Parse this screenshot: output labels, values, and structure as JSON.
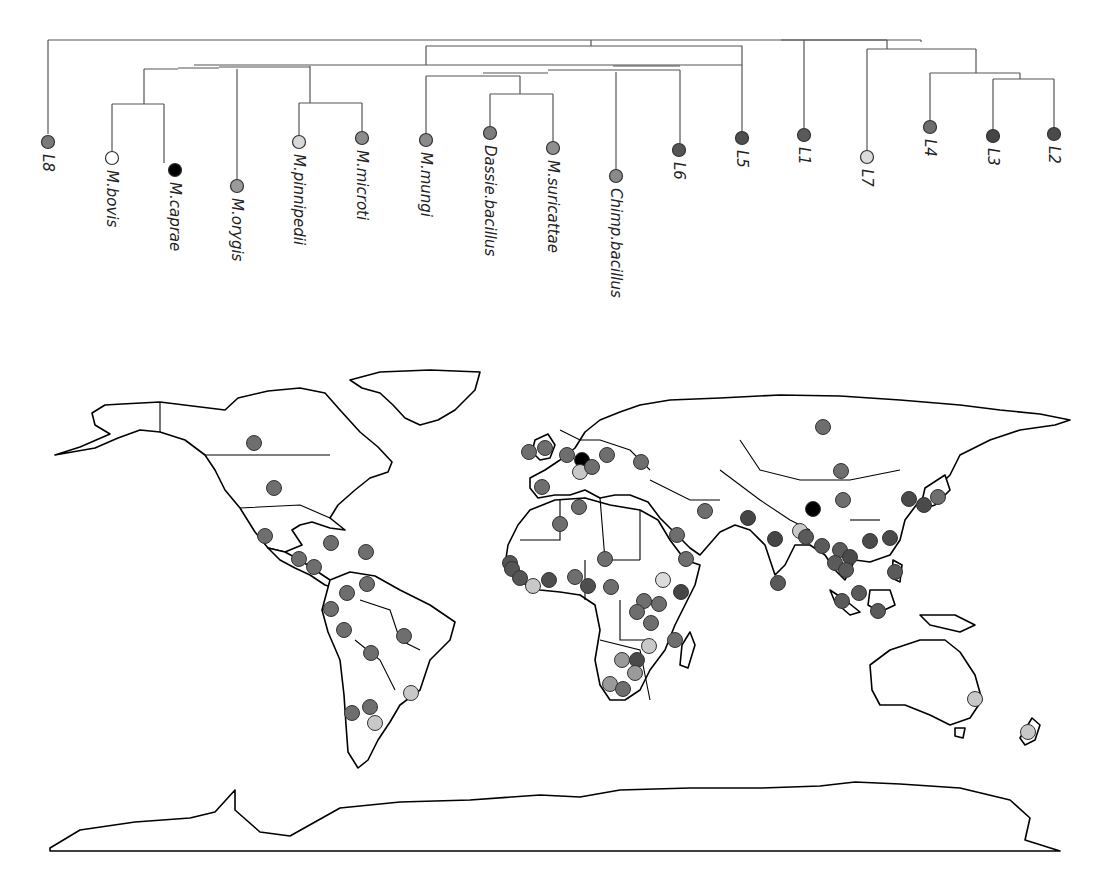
{
  "figure": {
    "colors": {
      "L1": "#5a5a5a",
      "L2": "#4a4a4a",
      "L3": "#454545",
      "L4": "#6e6e6e",
      "L5": "#4e4e4e",
      "L6": "#555555",
      "L7": "#dcdcdc",
      "L8": "#7a7a7a",
      "M.bovis": "#ffffff",
      "M.caprae": "#000000",
      "M.orygis": "#9a9a9a",
      "M.pinnipedii": "#d8d8d8",
      "M.microti": "#8c8c8c",
      "M.mungi": "#8a8a8a",
      "Dassie.bacillus": "#7c7c7c",
      "M.suricattae": "#8e8e8e",
      "Chimp.bacillus": "#8a8a8a",
      "animal_default": "#9a9a9a",
      "map_light": "#c8c8c8"
    }
  },
  "tree": {
    "leaves": [
      {
        "id": "L8",
        "label": "L8",
        "x": 48,
        "y": 142
      },
      {
        "id": "M.bovis",
        "label": "M.bovis",
        "x": 112,
        "y": 158
      },
      {
        "id": "M.caprae",
        "label": "M.caprae",
        "x": 175,
        "y": 170
      },
      {
        "id": "M.orygis",
        "label": "M.orygis",
        "x": 237,
        "y": 186
      },
      {
        "id": "M.pinnipedii",
        "label": "M.pinnipedii",
        "x": 299,
        "y": 142
      },
      {
        "id": "M.microti",
        "label": "M.microti",
        "x": 362,
        "y": 138
      },
      {
        "id": "M.mungi",
        "label": "M.mungi",
        "x": 426,
        "y": 140
      },
      {
        "id": "Dassie.bacillus",
        "label": "Dassie.bacillus",
        "x": 490,
        "y": 133
      },
      {
        "id": "M.suricattae",
        "label": "M.suricattae",
        "x": 553,
        "y": 148
      },
      {
        "id": "Chimp.bacillus",
        "label": "Chimp.bacillus",
        "x": 616,
        "y": 176
      },
      {
        "id": "L6",
        "label": "L6",
        "x": 679,
        "y": 150
      },
      {
        "id": "L5",
        "label": "L5",
        "x": 742,
        "y": 138
      },
      {
        "id": "L1",
        "label": "L1",
        "x": 804,
        "y": 135
      },
      {
        "id": "L7",
        "label": "L7",
        "x": 867,
        "y": 157
      },
      {
        "id": "L4",
        "label": "L4",
        "x": 930,
        "y": 127
      },
      {
        "id": "L3",
        "label": "L3",
        "x": 993,
        "y": 136
      },
      {
        "id": "L2",
        "label": "L2",
        "x": 1054,
        "y": 134
      }
    ]
  },
  "map": {
    "points": [
      {
        "region": "Canada",
        "x": 254,
        "y": 443,
        "lineage": "L4"
      },
      {
        "region": "USA",
        "x": 274,
        "y": 488,
        "lineage": "L4"
      },
      {
        "region": "Mexico",
        "x": 265,
        "y": 536,
        "lineage": "L4"
      },
      {
        "region": "Cuba",
        "x": 331,
        "y": 543,
        "lineage": "L4"
      },
      {
        "region": "Dominican Rep.",
        "x": 366,
        "y": 552,
        "lineage": "L4"
      },
      {
        "region": "Guatemala",
        "x": 299,
        "y": 559,
        "lineage": "L4"
      },
      {
        "region": "Honduras",
        "x": 314,
        "y": 567,
        "lineage": "L4"
      },
      {
        "region": "Venezuela",
        "x": 367,
        "y": 584,
        "lineage": "L4"
      },
      {
        "region": "Colombia",
        "x": 347,
        "y": 593,
        "lineage": "L4"
      },
      {
        "region": "Ecuador",
        "x": 331,
        "y": 609,
        "lineage": "L4"
      },
      {
        "region": "Peru",
        "x": 344,
        "y": 630,
        "lineage": "L4"
      },
      {
        "region": "Brazil",
        "x": 404,
        "y": 636,
        "lineage": "L4"
      },
      {
        "region": "Bolivia",
        "x": 371,
        "y": 653,
        "lineage": "L4"
      },
      {
        "region": "Uruguay/S.Brazil",
        "x": 411,
        "y": 693,
        "lineage": "light"
      },
      {
        "region": "Argentina",
        "x": 370,
        "y": 707,
        "lineage": "L4"
      },
      {
        "region": "Chile",
        "x": 352,
        "y": 713,
        "lineage": "L4"
      },
      {
        "region": "Argentina S",
        "x": 375,
        "y": 723,
        "lineage": "light"
      },
      {
        "region": "Ireland",
        "x": 529,
        "y": 452,
        "lineage": "L4"
      },
      {
        "region": "UK",
        "x": 545,
        "y": 448,
        "lineage": "L4"
      },
      {
        "region": "France N",
        "x": 567,
        "y": 455,
        "lineage": "L4"
      },
      {
        "region": "Germany",
        "x": 582,
        "y": 460,
        "lineage": "M.caprae"
      },
      {
        "region": "Switzerland",
        "x": 580,
        "y": 472,
        "lineage": "light"
      },
      {
        "region": "Austria",
        "x": 592,
        "y": 467,
        "lineage": "L4"
      },
      {
        "region": "Poland",
        "x": 607,
        "y": 455,
        "lineage": "L4"
      },
      {
        "region": "Ukraine",
        "x": 641,
        "y": 462,
        "lineage": "L4"
      },
      {
        "region": "Spain",
        "x": 542,
        "y": 487,
        "lineage": "L4"
      },
      {
        "region": "Tunisia",
        "x": 579,
        "y": 507,
        "lineage": "L4"
      },
      {
        "region": "Algeria",
        "x": 560,
        "y": 524,
        "lineage": "L4"
      },
      {
        "region": "Iran",
        "x": 705,
        "y": 511,
        "lineage": "L4"
      },
      {
        "region": "Saudi Arabia",
        "x": 677,
        "y": 535,
        "lineage": "L4"
      },
      {
        "region": "Yemen",
        "x": 686,
        "y": 559,
        "lineage": "L4"
      },
      {
        "region": "Niger",
        "x": 605,
        "y": 559,
        "lineage": "L4"
      },
      {
        "region": "Senegal",
        "x": 510,
        "y": 563,
        "lineage": "L6"
      },
      {
        "region": "Gambia",
        "x": 512,
        "y": 569,
        "lineage": "L6"
      },
      {
        "region": "Guinea",
        "x": 520,
        "y": 578,
        "lineage": "L6"
      },
      {
        "region": "Sierra Leone",
        "x": 533,
        "y": 586,
        "lineage": "light"
      },
      {
        "region": "Ghana",
        "x": 549,
        "y": 580,
        "lineage": "L5"
      },
      {
        "region": "Nigeria",
        "x": 575,
        "y": 577,
        "lineage": "L4"
      },
      {
        "region": "Cameroon",
        "x": 588,
        "y": 586,
        "lineage": "L5"
      },
      {
        "region": "CAR",
        "x": 611,
        "y": 587,
        "lineage": "L4"
      },
      {
        "region": "Ethiopia",
        "x": 663,
        "y": 580,
        "lineage": "L7"
      },
      {
        "region": "Somalia",
        "x": 681,
        "y": 592,
        "lineage": "L3"
      },
      {
        "region": "Uganda",
        "x": 644,
        "y": 601,
        "lineage": "L4"
      },
      {
        "region": "Kenya",
        "x": 659,
        "y": 604,
        "lineage": "L4"
      },
      {
        "region": "DRC E",
        "x": 637,
        "y": 612,
        "lineage": "L4"
      },
      {
        "region": "Tanzania",
        "x": 651,
        "y": 623,
        "lineage": "L4"
      },
      {
        "region": "Mozambique N",
        "x": 675,
        "y": 640,
        "lineage": "L4"
      },
      {
        "region": "Malawi",
        "x": 649,
        "y": 646,
        "lineage": "light"
      },
      {
        "region": "Zambia",
        "x": 622,
        "y": 660,
        "lineage": "M.orygis"
      },
      {
        "region": "Zimbabwe",
        "x": 637,
        "y": 660,
        "lineage": "L2"
      },
      {
        "region": "Botswana",
        "x": 635,
        "y": 673,
        "lineage": "M.orygis"
      },
      {
        "region": "Namibia S",
        "x": 610,
        "y": 684,
        "lineage": "M.orygis"
      },
      {
        "region": "South Africa",
        "x": 623,
        "y": 689,
        "lineage": "L4"
      },
      {
        "region": "Russia",
        "x": 823,
        "y": 427,
        "lineage": "L4"
      },
      {
        "region": "Mongolia",
        "x": 841,
        "y": 471,
        "lineage": "L4"
      },
      {
        "region": "China W",
        "x": 813,
        "y": 509,
        "lineage": "M.caprae"
      },
      {
        "region": "China",
        "x": 843,
        "y": 500,
        "lineage": "L4"
      },
      {
        "region": "Korea",
        "x": 909,
        "y": 499,
        "lineage": "L2"
      },
      {
        "region": "Japan S",
        "x": 924,
        "y": 505,
        "lineage": "L2"
      },
      {
        "region": "Japan",
        "x": 938,
        "y": 497,
        "lineage": "L4"
      },
      {
        "region": "Pakistan",
        "x": 748,
        "y": 518,
        "lineage": "L3"
      },
      {
        "region": "India",
        "x": 775,
        "y": 539,
        "lineage": "L3"
      },
      {
        "region": "Nepal",
        "x": 800,
        "y": 531,
        "lineage": "light"
      },
      {
        "region": "Bangladesh",
        "x": 806,
        "y": 537,
        "lineage": "L1"
      },
      {
        "region": "Sri Lanka",
        "x": 778,
        "y": 583,
        "lineage": "L1"
      },
      {
        "region": "Myanmar",
        "x": 822,
        "y": 546,
        "lineage": "L1"
      },
      {
        "region": "S.China",
        "x": 870,
        "y": 541,
        "lineage": "L2"
      },
      {
        "region": "Taiwan",
        "x": 890,
        "y": 538,
        "lineage": "L2"
      },
      {
        "region": "Laos",
        "x": 840,
        "y": 550,
        "lineage": "L1"
      },
      {
        "region": "Vietnam",
        "x": 850,
        "y": 557,
        "lineage": "L2"
      },
      {
        "region": "Thailand",
        "x": 835,
        "y": 563,
        "lineage": "L1"
      },
      {
        "region": "Cambodia",
        "x": 846,
        "y": 570,
        "lineage": "L1"
      },
      {
        "region": "Philippines",
        "x": 895,
        "y": 572,
        "lineage": "L1"
      },
      {
        "region": "Malaysia",
        "x": 859,
        "y": 593,
        "lineage": "L1"
      },
      {
        "region": "Indonesia W",
        "x": 842,
        "y": 601,
        "lineage": "L1"
      },
      {
        "region": "Indonesia",
        "x": 878,
        "y": 611,
        "lineage": "L1"
      },
      {
        "region": "Australia",
        "x": 975,
        "y": 699,
        "lineage": "light"
      },
      {
        "region": "New Zealand",
        "x": 1028,
        "y": 732,
        "lineage": "light"
      }
    ]
  }
}
